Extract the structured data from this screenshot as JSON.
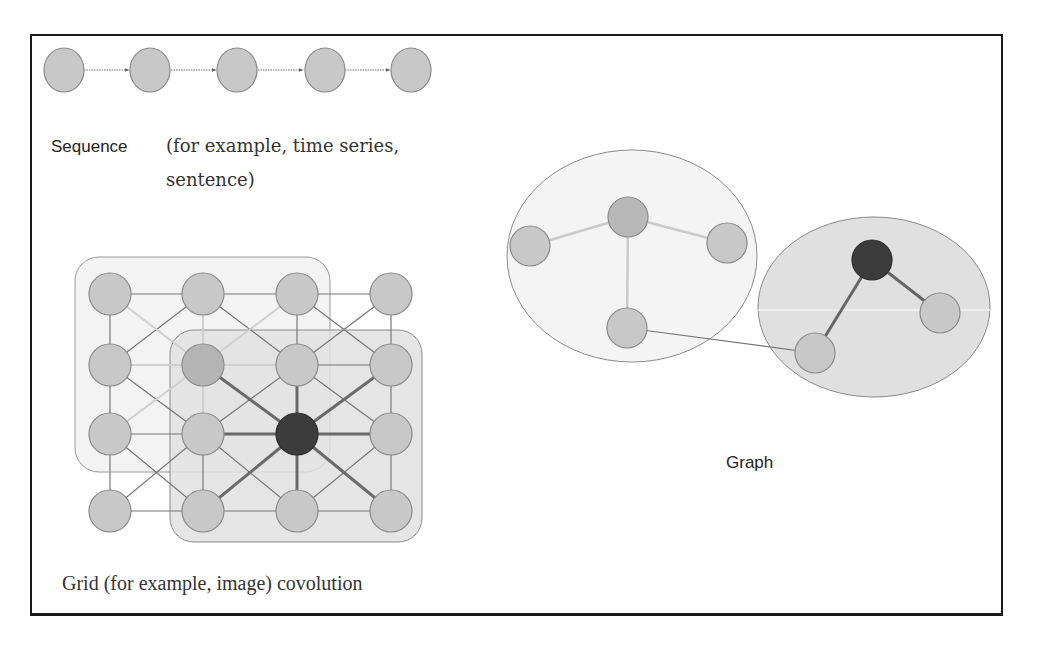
{
  "sections": {
    "sequence": {
      "label_main": "Sequence",
      "label_paren_line1": "(for example, time series,",
      "label_paren_line2": "sentence)",
      "node_count": 5
    },
    "grid": {
      "label": "Grid (for example, image) covolution",
      "rows": 4,
      "cols": 4,
      "highlight_node": "row 3, col 3"
    },
    "graph": {
      "label": "Graph",
      "clusters": 2
    }
  },
  "colors": {
    "node_fill": "#c8c8c8",
    "node_stroke": "#8a8a8a",
    "focus_node": "#3c3c3c",
    "edge": "#777777",
    "edge_light": "#c9c9c9",
    "region_light": "#f2f2f2",
    "region_dark": "#e2e2e2",
    "frame": "#1a1a1a"
  }
}
